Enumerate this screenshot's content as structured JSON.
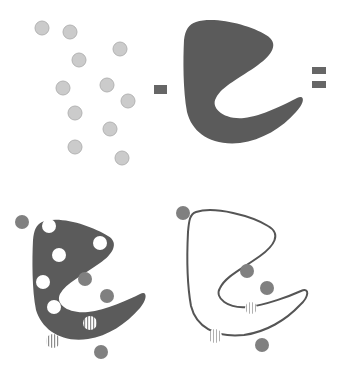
{
  "diagram": {
    "operators": [
      {
        "name": "minus",
        "symbol": "-"
      },
      {
        "name": "equals",
        "symbol": "="
      }
    ],
    "colors": {
      "free_molecule": "#cbcbcb",
      "free_molecule_stroke": "#b3b3b3",
      "shape_fill": "#5b5b5b",
      "outer_molecule": "#808080",
      "hole": "#ffffff",
      "stripe": "#8c8c8c",
      "outline": "#555555",
      "operator": "#666666"
    },
    "panels": [
      {
        "id": "molecules",
        "label": "Free molecules",
        "count": 11
      },
      {
        "id": "solid-shape",
        "label": "Solid binding shape"
      },
      {
        "id": "shape-with-holes",
        "label": "Shape with bound molecules (holes)"
      },
      {
        "id": "outline-shape",
        "label": "Shape outline with remaining molecules"
      }
    ]
  }
}
